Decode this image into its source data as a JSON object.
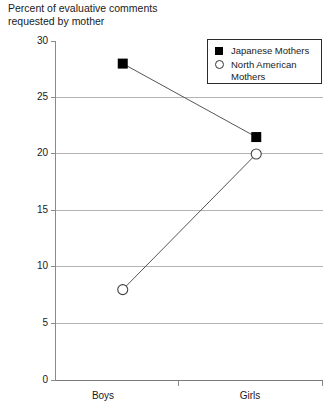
{
  "chart_data": {
    "type": "line",
    "title": "Percent of evaluative comments\nrequested by mother",
    "xlabel": "",
    "ylabel": "",
    "categories": [
      "Boys",
      "Girls"
    ],
    "series": [
      {
        "name": "Japanese Mothers",
        "marker": "filled-square",
        "values": [
          28,
          21.5
        ]
      },
      {
        "name": "North American Mothers",
        "marker": "open-circle",
        "values": [
          8,
          20
        ]
      }
    ],
    "ylim": [
      0,
      30
    ],
    "yticks": [
      0,
      5,
      10,
      15,
      20,
      25,
      30
    ],
    "ytick_labels": [
      "0",
      "5",
      "10",
      "15",
      "20",
      "25",
      "30"
    ],
    "grid": "horizontal",
    "legend_position": "top-right",
    "colors": {
      "line": "#555555",
      "marker_fill": "#000000",
      "marker_open": "#ffffff",
      "gridline": "#b4b4b4",
      "axis": "#8a8a8a",
      "text": "#1a1a1a",
      "background": "#ffffff"
    }
  },
  "axis": {
    "y_labels": {
      "t0": "0",
      "t5": "5",
      "t10": "10",
      "t15": "15",
      "t20": "20",
      "t25": "25",
      "t30": "30"
    },
    "x_labels": {
      "boys": "Boys",
      "girls": "Girls"
    }
  },
  "legend": {
    "japanese": "Japanese Mothers",
    "north_american": "North American\nMothers"
  }
}
